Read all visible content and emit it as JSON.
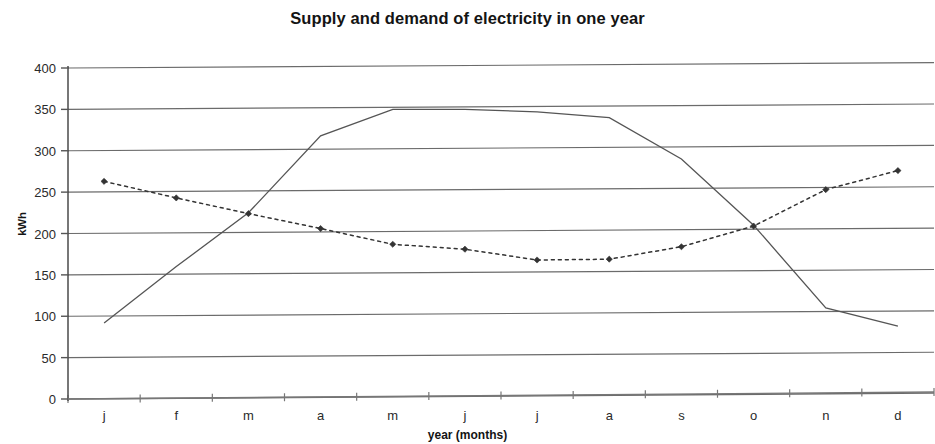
{
  "chart_data": {
    "type": "line",
    "title": "Supply and demand of electricity in one year",
    "xlabel": "year (months)",
    "ylabel": "kWh",
    "categories": [
      "j",
      "f",
      "m",
      "a",
      "m",
      "j",
      "j",
      "a",
      "s",
      "o",
      "n",
      "d"
    ],
    "ylim": [
      0,
      400
    ],
    "ytick_step": 50,
    "yticks": [
      0,
      50,
      100,
      150,
      200,
      250,
      300,
      350,
      400
    ],
    "grid": "horizontal",
    "legend": "none",
    "series": [
      {
        "name": "supply",
        "style": "solid",
        "marker": "none",
        "color": "#555555",
        "values": [
          92,
          160,
          225,
          318,
          350,
          350,
          347,
          340,
          290,
          210,
          110,
          88
        ]
      },
      {
        "name": "demand",
        "style": "dotted",
        "marker": "diamond",
        "color": "#333333",
        "values": [
          263,
          243,
          224,
          206,
          187,
          181,
          168,
          169,
          184,
          209,
          253,
          276
        ]
      }
    ]
  },
  "axes": {
    "y_labels": [
      "400",
      "350",
      "300",
      "250",
      "200",
      "150",
      "100",
      "50",
      "0"
    ],
    "x_labels": [
      "j",
      "f",
      "m",
      "a",
      "m",
      "j",
      "j",
      "a",
      "s",
      "o",
      "n",
      "d"
    ]
  }
}
